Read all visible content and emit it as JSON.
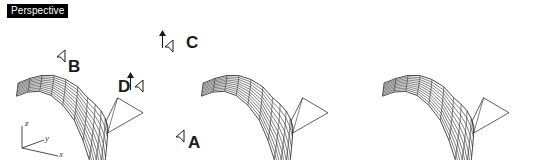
{
  "viewport": {
    "label": "Perspective",
    "background_color": "#ffffff",
    "wire_color": "#2b2b2b",
    "label_bg_color": "#000000",
    "label_text_color": "#ffffff"
  },
  "axis_indicator": {
    "name": "world-axis-gizmo",
    "axes": [
      {
        "id": "z",
        "label": "z",
        "direction": "up"
      },
      {
        "id": "y",
        "label": "y",
        "direction": "right-up"
      },
      {
        "id": "x",
        "label": "x",
        "direction": "right-down"
      }
    ]
  },
  "annotations": [
    {
      "id": "A",
      "label": "A",
      "target": "lower-right-edge-control-point",
      "cursor": "arrow"
    },
    {
      "id": "B",
      "label": "B",
      "target": "left-edge-control-point",
      "cursor": "arrow"
    },
    {
      "id": "C",
      "label": "C",
      "target": "upper-right-crease-point",
      "cursor": "arrow"
    },
    {
      "id": "D",
      "label": "D",
      "target": "mid-front-control-point",
      "cursor": "arrow"
    }
  ],
  "panels": [
    {
      "id": "panel-1",
      "name": "surface-view-labeled",
      "has_labels": true,
      "has_viewport_label": true,
      "has_axis_indicator": true
    },
    {
      "id": "panel-2",
      "name": "surface-view-middle",
      "has_labels": false,
      "has_viewport_label": false,
      "has_axis_indicator": false
    },
    {
      "id": "panel-3",
      "name": "surface-view-right",
      "has_labels": false,
      "has_viewport_label": false,
      "has_axis_indicator": false
    }
  ],
  "surface": {
    "type": "nurbs-wireframe-mesh",
    "u_divisions": 10,
    "v_divisions": 10,
    "description": "draped curved surface with peaked fin at upper right"
  }
}
